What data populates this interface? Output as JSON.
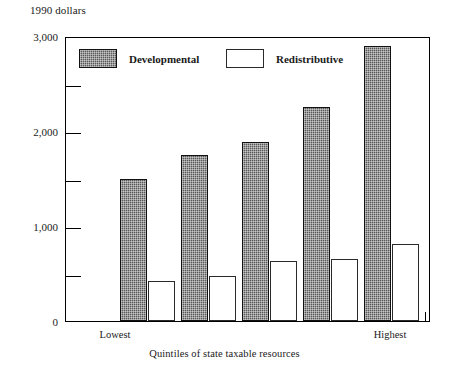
{
  "chart_data": {
    "type": "bar",
    "title": "",
    "ylabel": "1990 dollars",
    "xlabel": "Quintiles of state taxable resources",
    "ylim": [
      0,
      3000
    ],
    "ytick_values": [
      0,
      500,
      1000,
      1500,
      2000,
      2500,
      3000
    ],
    "ytick_labels": [
      "0",
      "",
      "1,000",
      "",
      "2,000",
      "",
      "3,000"
    ],
    "grid": false,
    "legend_position": "top-inside",
    "categories": [
      "Lowest",
      "",
      "",
      "",
      "Highest"
    ],
    "xtick_labels_shown": [
      "Lowest",
      "Highest"
    ],
    "series": [
      {
        "name": "Developmental",
        "values": [
          1500,
          1750,
          1880,
          2250,
          2890
        ]
      },
      {
        "name": "Redistributive",
        "values": [
          420,
          470,
          630,
          650,
          810
        ]
      }
    ]
  },
  "legend": {
    "items": [
      {
        "label": "Developmental",
        "swatch": "hatched-dark"
      },
      {
        "label": "Redistributive",
        "swatch": "white-outline"
      }
    ]
  },
  "axis": {
    "y_caption": "1990 dollars",
    "x_caption": "Quintiles of state taxable resources",
    "y_labels": [
      "3,000",
      "2,000",
      "1,000",
      "0"
    ],
    "x_labels": [
      "Lowest",
      "Highest"
    ]
  },
  "colors": {
    "developmental_fill": "#595959",
    "redistributive_fill": "#ffffff",
    "axis_line": "#000000",
    "background": "#ffffff"
  }
}
